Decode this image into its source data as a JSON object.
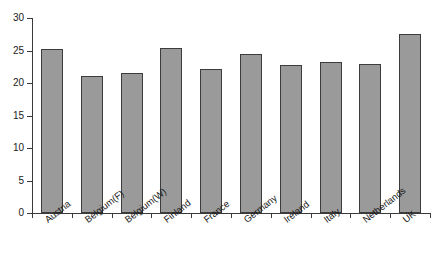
{
  "chart_data": {
    "type": "bar",
    "title": "",
    "subtitle": "",
    "xlabel": "",
    "ylabel": "",
    "categories": [
      "Austria",
      "Belgium(F)",
      "Belgium(W)",
      "Finland",
      "France",
      "Germany",
      "Ireland",
      "Italy",
      "Netherlands",
      "UK"
    ],
    "values": [
      25.3,
      21.1,
      21.5,
      25.4,
      22.2,
      24.5,
      22.8,
      23.2,
      23.0,
      27.5
    ],
    "ylim": [
      0,
      30
    ],
    "yticks": [
      0,
      5,
      10,
      15,
      20,
      25,
      30
    ],
    "ytick_labels": [
      "0",
      "5",
      "10",
      "15",
      "20",
      "25",
      "30"
    ],
    "grid": false,
    "legend": false,
    "legend_position": "none",
    "bar_fill_color": "#9a9a9a",
    "bar_edge_color": "#3c3c3c",
    "axis_color": "#3a3a3a",
    "background_color": "#ffffff",
    "xtick_label_rotation": -38
  }
}
